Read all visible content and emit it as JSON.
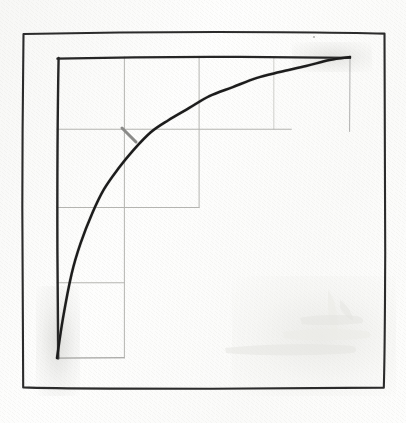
{
  "figure": {
    "title": "",
    "style": "hand-drawn pencil sketch on paper",
    "canvas_width": 406,
    "canvas_height": 423,
    "background_color": "#fdfdfc",
    "ink_color": "#1c1c1c",
    "grid_color": "#b4b4b0",
    "marker_color": "#8a8a88"
  },
  "outer_frame": {
    "name": "outer-border",
    "x": 22,
    "y": 32,
    "width": 363,
    "height": 356,
    "stroke_color": "#2b2b2b"
  },
  "plot_frame": {
    "name": "plot-area",
    "left": 57,
    "top": 57,
    "right": 350,
    "bottom": 358,
    "axis_color": "#262626",
    "drawn_edges": [
      "left",
      "top"
    ]
  },
  "annotations": {
    "margin_dot": {
      "x": 313,
      "y": 36,
      "color": "#9a9a97"
    },
    "tick_marker": {
      "name": "slope-tick",
      "x1": 122,
      "y1": 128,
      "x2": 136,
      "y2": 142,
      "color": "#8a8a88"
    },
    "smudge_label": "pencil smudge"
  },
  "chart_data": {
    "type": "line",
    "title": "",
    "xlabel": "",
    "ylabel": "",
    "xlim": [
      0,
      1
    ],
    "ylim": [
      0,
      1
    ],
    "grid": true,
    "grid_style": "partial stepped gridlines",
    "legend": null,
    "x_ticks": [
      0,
      0.23,
      0.485,
      0.74,
      1
    ],
    "y_ticks": [
      0,
      0.25,
      0.5,
      0.76,
      1
    ],
    "series": [
      {
        "name": "saturating-curve",
        "color": "#1c1c1c",
        "x": [
          0.0,
          0.02,
          0.05,
          0.08,
          0.12,
          0.16,
          0.21,
          0.26,
          0.32,
          0.38,
          0.45,
          0.52,
          0.6,
          0.68,
          0.76,
          0.85,
          0.93,
          1.0
        ],
        "y": [
          0.0,
          0.13,
          0.28,
          0.38,
          0.48,
          0.56,
          0.63,
          0.69,
          0.75,
          0.79,
          0.83,
          0.87,
          0.9,
          0.93,
          0.95,
          0.97,
          0.99,
          1.0
        ]
      }
    ],
    "gridlines": {
      "vertical": [
        {
          "x": 0.23,
          "y_from": 0.0,
          "y_to": 1.0
        },
        {
          "x": 0.485,
          "y_from": 0.5,
          "y_to": 1.0
        },
        {
          "x": 0.74,
          "y_from": 0.76,
          "y_to": 1.0
        }
      ],
      "horizontal": [
        {
          "y": 0.76,
          "x_from": 0.0,
          "x_to": 0.8
        },
        {
          "y": 0.5,
          "x_from": 0.0,
          "x_to": 0.485
        },
        {
          "y": 0.25,
          "x_from": 0.0,
          "x_to": 0.23
        }
      ]
    }
  }
}
